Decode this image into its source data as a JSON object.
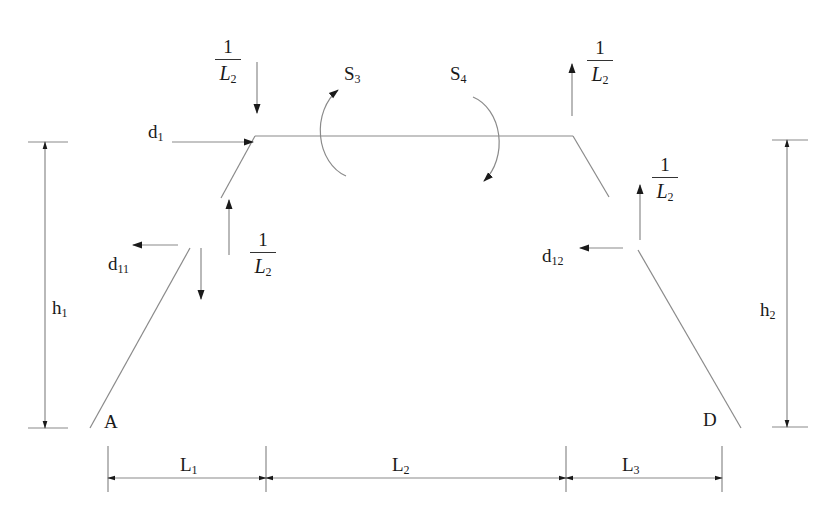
{
  "diagram": {
    "type": "structural frame free-body / unit-load diagram",
    "colors": {
      "line": "#8a8a8a",
      "arrow": "#1a1a1a",
      "text": "#1a1a1a"
    },
    "nodes": {
      "A": {
        "label": "A"
      },
      "D": {
        "label": "D"
      }
    },
    "moments": [
      {
        "id": "S3",
        "base": "S",
        "sub": "3",
        "direction": "counterclockwise"
      },
      {
        "id": "S4",
        "base": "S",
        "sub": "4",
        "direction": "clockwise"
      }
    ],
    "forces": [
      {
        "id": "d1",
        "base": "d",
        "sub": "1",
        "direction": "right"
      },
      {
        "id": "d11",
        "base": "d",
        "sub": "11",
        "direction": "left"
      },
      {
        "id": "d12",
        "base": "d",
        "sub": "12",
        "direction": "left"
      }
    ],
    "unit_loads": [
      {
        "id": "top-left",
        "num": "1",
        "den_base": "L",
        "den_sub": "2",
        "direction": "down"
      },
      {
        "id": "mid-left",
        "num": "1",
        "den_base": "L",
        "den_sub": "2",
        "direction": "up"
      },
      {
        "id": "top-right",
        "num": "1",
        "den_base": "L",
        "den_sub": "2",
        "direction": "up"
      },
      {
        "id": "mid-right",
        "num": "1",
        "den_base": "L",
        "den_sub": "2",
        "direction": "up"
      }
    ],
    "dimensions": {
      "h1": {
        "base": "h",
        "sub": "1"
      },
      "h2": {
        "base": "h",
        "sub": "2"
      },
      "L1": {
        "base": "L",
        "sub": "1"
      },
      "L2": {
        "base": "L",
        "sub": "2"
      },
      "L3": {
        "base": "L",
        "sub": "3"
      }
    }
  }
}
